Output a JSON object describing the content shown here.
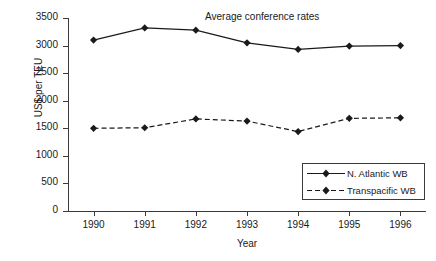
{
  "chart_data": {
    "type": "line",
    "title": "Average conference rates",
    "xlabel": "Year",
    "ylabel": "US$ per TEU",
    "categories": [
      "1990",
      "1991",
      "1992",
      "1993",
      "1994",
      "1995",
      "1996"
    ],
    "x": [
      1990,
      1991,
      1992,
      1993,
      1994,
      1995,
      1996
    ],
    "ylim": [
      0,
      3500
    ],
    "yticks": [
      0,
      500,
      1000,
      1500,
      2000,
      2500,
      3000,
      3500
    ],
    "ytick_labels": [
      "0",
      "500",
      "1000",
      "1500",
      "2000",
      "2500",
      "3000",
      "3500"
    ],
    "grid": false,
    "legend_position": "lower-right",
    "series": [
      {
        "name": "N. Atlantic WB",
        "line_style": "solid",
        "marker": "diamond",
        "color": "#1a1a1a",
        "values": [
          3100,
          3320,
          3280,
          3050,
          2930,
          2990,
          3000
        ]
      },
      {
        "name": "Transpacific WB",
        "line_style": "dashed",
        "marker": "diamond",
        "color": "#1a1a1a",
        "values": [
          1500,
          1510,
          1670,
          1630,
          1440,
          1680,
          1690
        ]
      }
    ]
  },
  "legend": {
    "items": [
      {
        "label": "N. Atlantic WB"
      },
      {
        "label": "Transpacific WB"
      }
    ]
  }
}
